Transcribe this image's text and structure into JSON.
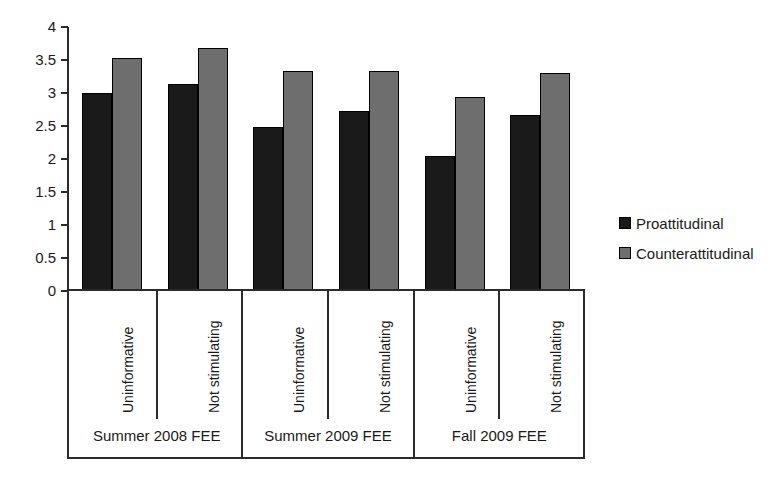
{
  "chart_data": {
    "type": "bar",
    "title": "",
    "xlabel": "",
    "ylabel": "",
    "ylim": [
      0,
      4
    ],
    "ytick_labels": [
      "4",
      "3.5",
      "3",
      "2.5",
      "2",
      "1.5",
      "1",
      "0.5",
      "0"
    ],
    "ytick_values": [
      4,
      3.5,
      3,
      2.5,
      2,
      1.5,
      1,
      0.5,
      0
    ],
    "grid": false,
    "legend_position": "right",
    "categories": [
      "Uninformative",
      "Not stimulating",
      "Uninformative",
      "Not stimulating",
      "Uninformative",
      "Not stimulating"
    ],
    "groups": [
      {
        "label": "Summer 2008 FEE",
        "categories": [
          "Uninformative",
          "Not stimulating"
        ]
      },
      {
        "label": "Summer 2009 FEE",
        "categories": [
          "Uninformative",
          "Not stimulating"
        ]
      },
      {
        "label": "Fall 2009 FEE",
        "categories": [
          "Uninformative",
          "Not stimulating"
        ]
      }
    ],
    "series": [
      {
        "name": "Proattitudinal",
        "color": "#1a1a1a",
        "values": [
          3.0,
          3.13,
          2.49,
          2.73,
          2.04,
          2.67
        ]
      },
      {
        "name": "Counterattitudinal",
        "color": "#6e6e6e",
        "values": [
          3.53,
          3.68,
          3.33,
          3.33,
          2.94,
          3.31
        ]
      }
    ]
  },
  "legend": {
    "entries": [
      {
        "label": "Proattitudinal",
        "swatch": "series-proattitudinal"
      },
      {
        "label": "Counterattitudinal",
        "swatch": "series-counterattitudinal"
      }
    ]
  }
}
